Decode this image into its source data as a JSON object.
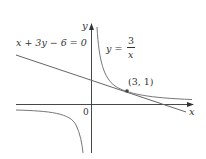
{
  "figure": {
    "equation_line": "x + 3y − 6 = 0",
    "curve_label_lhs": "y =",
    "curve_label_num": "3",
    "curve_label_den": "x",
    "point_label": "(3, 1)",
    "origin_label": "0",
    "x_axis_label": "x",
    "y_axis_label": "y",
    "colors": {
      "curve": "#777777",
      "line": "#666666",
      "axes": "#333333",
      "point": "#444444"
    }
  }
}
